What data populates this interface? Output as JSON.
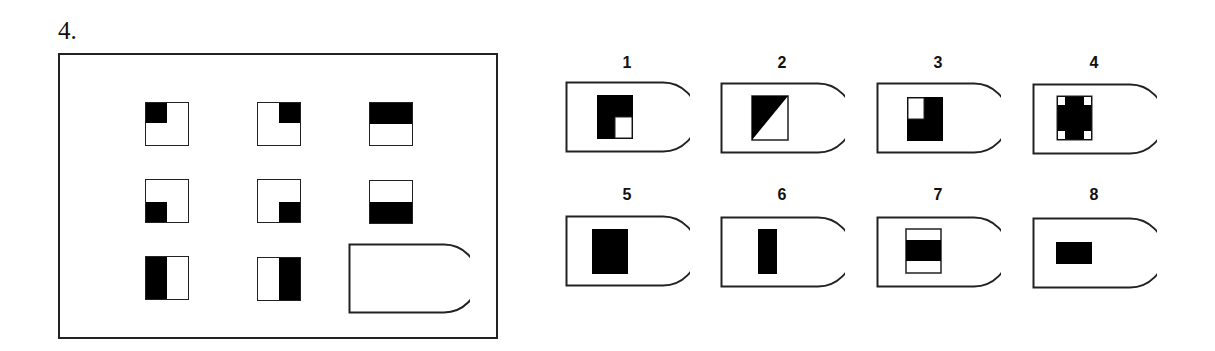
{
  "question": {
    "number": "4.",
    "matrix": {
      "rows": [
        [
          {
            "pattern": "top-left-quadrant-black"
          },
          {
            "pattern": "top-right-quadrant-black"
          },
          {
            "pattern": "top-half-black"
          }
        ],
        [
          {
            "pattern": "bottom-left-quadrant-black"
          },
          {
            "pattern": "bottom-right-quadrant-black"
          },
          {
            "pattern": "bottom-half-black"
          }
        ],
        [
          {
            "pattern": "left-half-black"
          },
          {
            "pattern": "right-half-black"
          },
          {
            "pattern": "missing-answer-slot"
          }
        ]
      ]
    },
    "options": [
      {
        "label": "1",
        "pattern": "square-black-with-white-bottom-right-quadrant"
      },
      {
        "label": "2",
        "pattern": "square-diagonal-top-left-triangle-black"
      },
      {
        "label": "3",
        "pattern": "square-black-with-white-top-left-quadrant"
      },
      {
        "label": "4",
        "pattern": "square-black-with-four-white-corners"
      },
      {
        "label": "5",
        "pattern": "large-black-rectangle"
      },
      {
        "label": "6",
        "pattern": "narrow-vertical-black-bar"
      },
      {
        "label": "7",
        "pattern": "square-with-middle-horizontal-black-band"
      },
      {
        "label": "8",
        "pattern": "small-horizontal-black-rectangle"
      }
    ]
  },
  "colors": {
    "ink": "#000000",
    "outline": "#222222",
    "background": "#ffffff"
  }
}
